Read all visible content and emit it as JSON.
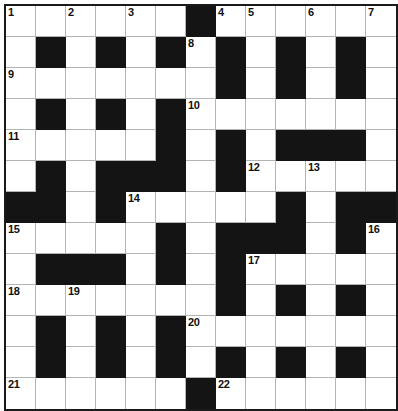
{
  "puzzle": {
    "title": "Crossword Grid",
    "type": "crossword",
    "rows": 13,
    "columns": 13,
    "cell_size_px": 30,
    "colors": {
      "block": "#141414",
      "light": "#ffffff",
      "grid_line": "#b4b4b4",
      "border": "#1a1a1a",
      "number_text": "#111111"
    },
    "numbers_visible": [
      1,
      2,
      3,
      4,
      5,
      6,
      7,
      8,
      9,
      10,
      11,
      12,
      13,
      14,
      15,
      16,
      17,
      18,
      19,
      20,
      21,
      22
    ],
    "grid": [
      [
        "1",
        "",
        "2",
        "",
        "3",
        "",
        "#",
        "4",
        "5",
        "",
        "6",
        "",
        "7"
      ],
      [
        "",
        "#",
        "",
        "#",
        "",
        "#",
        "8",
        "#",
        "",
        "#",
        "",
        "#",
        ""
      ],
      [
        "9",
        "",
        "",
        "",
        "",
        "",
        "",
        "#",
        "",
        "#",
        "",
        "#",
        ""
      ],
      [
        "",
        "#",
        "",
        "#",
        "",
        "#",
        "10",
        "",
        "",
        "",
        "",
        "",
        ""
      ],
      [
        "11",
        "",
        "",
        "",
        "",
        "#",
        "",
        "#",
        "",
        "#",
        "#",
        "#",
        ""
      ],
      [
        "",
        "#",
        "",
        "#",
        "#",
        "#",
        "",
        "#",
        "12",
        "",
        "13",
        "",
        ""
      ],
      [
        "#",
        "#",
        "",
        "#",
        "14",
        "",
        "",
        "",
        "",
        "#",
        "",
        "#",
        "#"
      ],
      [
        "15",
        "",
        "",
        "",
        "",
        "#",
        "",
        "#",
        "#",
        "#",
        "",
        "#",
        "16"
      ],
      [
        "",
        "#",
        "#",
        "#",
        "",
        "#",
        "",
        "#",
        "17",
        "",
        "",
        "",
        ""
      ],
      [
        "18",
        "",
        "19",
        "",
        "",
        "",
        "",
        "#",
        "",
        "#",
        "",
        "#",
        ""
      ],
      [
        "",
        "#",
        "",
        "#",
        "",
        "#",
        "20",
        "",
        "",
        "",
        "",
        "",
        ""
      ],
      [
        "",
        "#",
        "",
        "#",
        "",
        "#",
        "",
        "#",
        "",
        "#",
        "",
        "#",
        ""
      ],
      [
        "21",
        "",
        "",
        "",
        "",
        "",
        "#",
        "22",
        "",
        "",
        "",
        "",
        ""
      ]
    ]
  }
}
